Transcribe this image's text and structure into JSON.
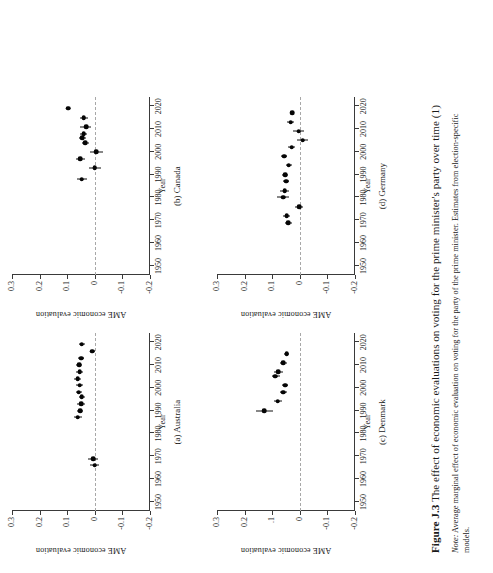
{
  "figure": {
    "caption_label": "Figure J.3",
    "caption_text": "The effect of economic evaluations on voting for the prime minister's party over time (1)",
    "note_label": "Note:",
    "note_text": "Average marginal effect of economic evaluation on voting for the party of the prime minister. Estimates from election-specific models."
  },
  "axes": {
    "ylabel": "AME economic evaluation",
    "xlabel": "Year",
    "xticks": [
      "1950",
      "1960",
      "1970",
      "1980",
      "1990",
      "2000",
      "2010",
      "2020"
    ],
    "xtick_values": [
      1950,
      1960,
      1970,
      1980,
      1990,
      2000,
      2010,
      2020
    ],
    "yticks_standard": [
      "0.3",
      "0.2",
      "0.1",
      "0",
      "-0.1",
      "-0.2"
    ],
    "yticks_denmark": [
      "0.3",
      "0.2",
      ".1",
      "0",
      "-0.1",
      "-0.2"
    ],
    "ytick_values": [
      0.3,
      0.2,
      0.1,
      0,
      -0.1,
      -0.2
    ],
    "xlim": [
      1946,
      2024
    ],
    "ylim": [
      -0.2,
      0.3
    ],
    "reference_line": 0
  },
  "chart_data": [
    {
      "type": "scatter",
      "panel": "a",
      "title": "(a) Australia",
      "xlabel": "Year",
      "ylabel": "AME economic evaluation",
      "xlim": [
        1946,
        2024
      ],
      "ylim": [
        -0.2,
        0.3
      ],
      "grid": false,
      "legend": "none",
      "marker": "filled-circle-with-horizontal-errorbar",
      "x": [
        1966,
        1969,
        1987,
        1990,
        1993,
        1996,
        1998,
        2001,
        2004,
        2007,
        2010,
        2013,
        2016,
        2019
      ],
      "y": [
        0.0,
        0.005,
        0.062,
        0.053,
        0.05,
        0.047,
        0.058,
        0.055,
        0.062,
        0.055,
        0.057,
        0.05,
        0.01,
        0.047
      ],
      "ci_low": [
        -0.017,
        -0.013,
        0.048,
        0.041,
        0.037,
        0.035,
        0.047,
        0.043,
        0.05,
        0.042,
        0.047,
        0.04,
        0.001,
        0.036
      ],
      "ci_high": [
        0.017,
        0.024,
        0.076,
        0.065,
        0.063,
        0.059,
        0.069,
        0.067,
        0.074,
        0.068,
        0.067,
        0.06,
        0.019,
        0.058
      ]
    },
    {
      "type": "scatter",
      "panel": "b",
      "title": "(b) Canada",
      "xlabel": "Year",
      "ylabel": "AME economic evaluation",
      "xlim": [
        1946,
        2024
      ],
      "ylim": [
        -0.2,
        0.3
      ],
      "grid": false,
      "legend": "none",
      "marker": "filled-circle-with-horizontal-errorbar",
      "x": [
        1988,
        1993,
        1997,
        2000,
        2004,
        2006,
        2008,
        2011,
        2015,
        2019
      ],
      "y": [
        0.047,
        0.0,
        0.053,
        -0.005,
        0.035,
        0.046,
        0.04,
        0.032,
        0.04,
        0.097
      ],
      "ci_low": [
        0.03,
        -0.022,
        0.037,
        -0.028,
        0.022,
        0.033,
        0.028,
        0.012,
        0.026,
        0.09
      ],
      "ci_high": [
        0.064,
        0.022,
        0.069,
        0.018,
        0.048,
        0.059,
        0.052,
        0.052,
        0.054,
        0.104
      ]
    },
    {
      "type": "scatter",
      "panel": "c",
      "title": "(c) Denmark",
      "xlabel": "Year",
      "ylabel": "AME economic evaluation",
      "xlim": [
        1946,
        2024
      ],
      "ylim": [
        -0.2,
        0.3
      ],
      "grid": false,
      "legend": "none",
      "marker": "filled-circle-with-horizontal-errorbar",
      "x": [
        1990,
        1994,
        1998,
        2001,
        2005,
        2007,
        2011,
        2015
      ],
      "y": [
        0.128,
        0.08,
        0.06,
        0.053,
        0.09,
        0.078,
        0.06,
        0.048
      ],
      "ci_low": [
        0.098,
        0.066,
        0.048,
        0.042,
        0.072,
        0.062,
        0.048,
        0.038
      ],
      "ci_high": [
        0.158,
        0.094,
        0.072,
        0.064,
        0.101,
        0.094,
        0.072,
        0.058
      ]
    },
    {
      "type": "scatter",
      "panel": "d",
      "title": "(d) Germany",
      "xlabel": "Year",
      "ylabel": "AME economic evaluation",
      "xlim": [
        1946,
        2024
      ],
      "ylim": [
        -0.2,
        0.3
      ],
      "grid": false,
      "legend": "none",
      "marker": "filled-circle-with-horizontal-errorbar",
      "x": [
        1969,
        1972,
        1976,
        1980,
        1983,
        1987,
        1990,
        1994,
        1998,
        2002,
        2005,
        2009,
        2013,
        2017
      ],
      "y": [
        0.041,
        0.047,
        0.003,
        0.06,
        0.055,
        0.05,
        0.052,
        0.04,
        0.057,
        0.03,
        -0.01,
        0.004,
        0.033,
        0.028
      ],
      "ci_low": [
        0.03,
        0.034,
        -0.012,
        0.038,
        0.04,
        0.038,
        0.041,
        0.029,
        0.046,
        0.018,
        -0.03,
        -0.016,
        0.02,
        0.02
      ],
      "ci_high": [
        0.052,
        0.06,
        0.018,
        0.082,
        0.07,
        0.062,
        0.063,
        0.051,
        0.068,
        0.042,
        0.01,
        0.024,
        0.046,
        0.036
      ]
    }
  ]
}
